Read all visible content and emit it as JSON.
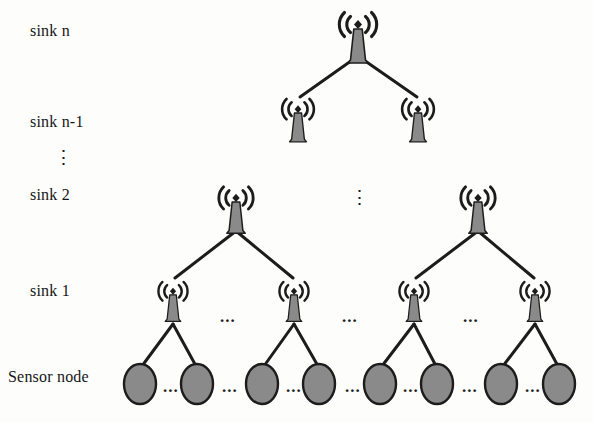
{
  "figure": {
    "kind": "hierarchical-wireless-sensor-network-tree",
    "background_color": "#fdfdfc",
    "node_fill_color": "#8a8a8a",
    "node_stroke_color": "#1c1c1c",
    "edge_color": "#1c1c1c",
    "text_color": "#151515"
  },
  "row_labels": [
    {
      "id": "sink-n",
      "text": "sink n",
      "x": 30,
      "y": 22
    },
    {
      "id": "sink-n-1",
      "text": "sink n-1",
      "x": 30,
      "y": 113
    },
    {
      "id": "sink-2",
      "text": "sink 2",
      "x": 30,
      "y": 186
    },
    {
      "id": "sink-1",
      "text": "sink 1",
      "x": 30,
      "y": 282
    },
    {
      "id": "sensor-node",
      "text": "Sensor node",
      "x": 8,
      "y": 368
    }
  ],
  "label_vertical_ellipsis": {
    "text": "⋮",
    "x": 54,
    "y": 148
  },
  "middle_vertical_ellipsis": {
    "text": "⋮",
    "x": 350,
    "y": 188
  },
  "horizontal_ellipses": [
    {
      "text": "...",
      "x": 220,
      "y": 308
    },
    {
      "text": "...",
      "x": 342,
      "y": 308
    },
    {
      "text": "...",
      "x": 463,
      "y": 308
    },
    {
      "text": "...",
      "x": 163,
      "y": 378
    },
    {
      "text": "...",
      "x": 222,
      "y": 378
    },
    {
      "text": "...",
      "x": 286,
      "y": 378
    },
    {
      "text": "...",
      "x": 345,
      "y": 378
    },
    {
      "text": "...",
      "x": 403,
      "y": 378
    },
    {
      "text": "...",
      "x": 462,
      "y": 378
    },
    {
      "text": "...",
      "x": 525,
      "y": 378
    }
  ],
  "towers": [
    {
      "id": "tower-sink-n",
      "level": "sink n",
      "x": 358,
      "y": 18,
      "scale": 1.0
    },
    {
      "id": "tower-sink-n1-left",
      "level": "sink n-1",
      "x": 298,
      "y": 100,
      "scale": 0.85
    },
    {
      "id": "tower-sink-n1-right",
      "level": "sink n-1",
      "x": 418,
      "y": 100,
      "scale": 0.85
    },
    {
      "id": "tower-sink-2-left",
      "level": "sink 2",
      "x": 236,
      "y": 190,
      "scale": 0.92
    },
    {
      "id": "tower-sink-2-right",
      "level": "sink 2",
      "x": 478,
      "y": 190,
      "scale": 0.92
    },
    {
      "id": "tower-sink-1-a",
      "level": "sink 1",
      "x": 173,
      "y": 281,
      "scale": 0.78
    },
    {
      "id": "tower-sink-1-b",
      "level": "sink 1",
      "x": 294,
      "y": 281,
      "scale": 0.78
    },
    {
      "id": "tower-sink-1-c",
      "level": "sink 1",
      "x": 414,
      "y": 281,
      "scale": 0.78
    },
    {
      "id": "tower-sink-1-d",
      "level": "sink 1",
      "x": 535,
      "y": 281,
      "scale": 0.78
    }
  ],
  "sensor_nodes": [
    {
      "id": "sensor-1",
      "x": 140,
      "y": 384,
      "rx": 16,
      "ry": 20
    },
    {
      "id": "sensor-2",
      "x": 197,
      "y": 384,
      "rx": 16,
      "ry": 20
    },
    {
      "id": "sensor-3",
      "x": 262,
      "y": 384,
      "rx": 16,
      "ry": 20
    },
    {
      "id": "sensor-4",
      "x": 319,
      "y": 384,
      "rx": 16,
      "ry": 20
    },
    {
      "id": "sensor-5",
      "x": 380,
      "y": 384,
      "rx": 16,
      "ry": 20
    },
    {
      "id": "sensor-6",
      "x": 437,
      "y": 384,
      "rx": 16,
      "ry": 20
    },
    {
      "id": "sensor-7",
      "x": 501,
      "y": 384,
      "rx": 16,
      "ry": 20
    },
    {
      "id": "sensor-8",
      "x": 559,
      "y": 384,
      "rx": 16,
      "ry": 20
    }
  ],
  "edges": [
    {
      "id": "edge-sinkn-to-n1-left",
      "x1": 358,
      "y1": 56,
      "x2": 300,
      "y2": 97
    },
    {
      "id": "edge-sinkn-to-n1-right",
      "x1": 358,
      "y1": 56,
      "x2": 417,
      "y2": 97
    },
    {
      "id": "edge-sink2l-to-sink1a",
      "x1": 236,
      "y1": 231,
      "x2": 175,
      "y2": 278
    },
    {
      "id": "edge-sink2l-to-sink1b",
      "x1": 236,
      "y1": 231,
      "x2": 293,
      "y2": 278
    },
    {
      "id": "edge-sink2r-to-sink1c",
      "x1": 478,
      "y1": 231,
      "x2": 416,
      "y2": 278
    },
    {
      "id": "edge-sink2r-to-sink1d",
      "x1": 478,
      "y1": 231,
      "x2": 534,
      "y2": 278
    },
    {
      "id": "edge-sink1a-to-sensor1",
      "x1": 173,
      "y1": 324,
      "x2": 142,
      "y2": 366
    },
    {
      "id": "edge-sink1a-to-sensor2",
      "x1": 173,
      "y1": 324,
      "x2": 196,
      "y2": 366
    },
    {
      "id": "edge-sink1b-to-sensor3",
      "x1": 294,
      "y1": 324,
      "x2": 264,
      "y2": 366
    },
    {
      "id": "edge-sink1b-to-sensor4",
      "x1": 294,
      "y1": 324,
      "x2": 318,
      "y2": 366
    },
    {
      "id": "edge-sink1c-to-sensor5",
      "x1": 414,
      "y1": 324,
      "x2": 382,
      "y2": 366
    },
    {
      "id": "edge-sink1c-to-sensor6",
      "x1": 414,
      "y1": 324,
      "x2": 436,
      "y2": 366
    },
    {
      "id": "edge-sink1d-to-sensor7",
      "x1": 535,
      "y1": 324,
      "x2": 503,
      "y2": 366
    },
    {
      "id": "edge-sink1d-to-sensor8",
      "x1": 535,
      "y1": 324,
      "x2": 558,
      "y2": 366
    }
  ]
}
